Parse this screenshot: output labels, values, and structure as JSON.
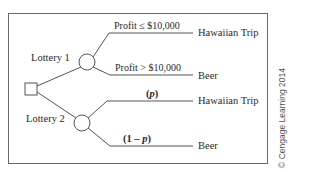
{
  "diagram": {
    "type": "decision-tree",
    "decision_node": {
      "shape": "square",
      "label": ""
    },
    "lotteries": [
      {
        "label": "Lottery 1",
        "branches": [
          {
            "condition": "Profit ≤ $10,000",
            "outcome": "Hawaiian Trip"
          },
          {
            "condition": "Profit > $10,000",
            "outcome": "Beer"
          }
        ]
      },
      {
        "label": "Lottery 2",
        "branches": [
          {
            "probability": "(p)",
            "prob_open": "(",
            "prob_var": "p",
            "prob_close": ")",
            "outcome": "Hawaiian Trip"
          },
          {
            "probability": "(1 – p)",
            "prob_open": "(1 – ",
            "prob_var": "p",
            "prob_close": ")",
            "outcome": "Beer"
          }
        ]
      }
    ],
    "copyright": "© Cengage Learning 2014"
  },
  "colors": {
    "line": "#555555",
    "text": "#2a2a2a",
    "frame": "#6a6a6a",
    "copyright": "#555555"
  }
}
